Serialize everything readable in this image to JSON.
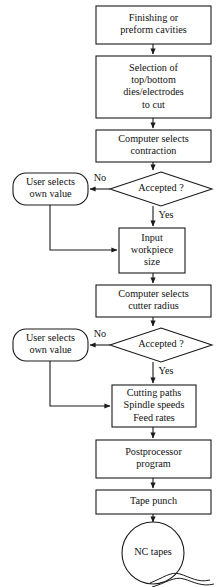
{
  "diagram": {
    "background_color": "#ffffff",
    "line_color": "#1a1a1a",
    "text_color": "#111111",
    "nodes": [
      {
        "id": "finishing",
        "name": "node-finishing-or-preform-cavities",
        "shape": "rect",
        "x": 96,
        "y": 6,
        "w": 115,
        "h": 38,
        "lines": [
          "Finishing or",
          "preform cavities"
        ]
      },
      {
        "id": "selection",
        "name": "node-selection-of-dies-electrodes",
        "shape": "rect",
        "x": 96,
        "y": 56,
        "w": 115,
        "h": 62,
        "lines": [
          "Selection of",
          "top/bottom",
          "dies/electrodes",
          "to cut"
        ]
      },
      {
        "id": "contraction",
        "name": "node-computer-selects-contraction",
        "shape": "rect",
        "x": 96,
        "y": 130,
        "w": 115,
        "h": 32,
        "lines": [
          "Computer selects",
          "contraction"
        ]
      },
      {
        "id": "accepted1",
        "name": "decision-accepted-contraction",
        "shape": "diamond",
        "x": 110,
        "y": 172,
        "w": 102,
        "h": 34,
        "lines": [
          "Accepted ?"
        ]
      },
      {
        "id": "uservalue1",
        "name": "node-user-selects-own-value-contraction",
        "shape": "roundrect",
        "x": 13,
        "y": 173,
        "w": 75,
        "h": 32,
        "lines": [
          "User selects",
          "own value"
        ]
      },
      {
        "id": "inputsize",
        "name": "node-input-workpiece-size",
        "shape": "rect",
        "x": 119,
        "y": 228,
        "w": 66,
        "h": 45,
        "lines": [
          "Input",
          "workpiece",
          "size"
        ]
      },
      {
        "id": "cutterradius",
        "name": "node-computer-selects-cutter-radius",
        "shape": "rect",
        "x": 96,
        "y": 285,
        "w": 115,
        "h": 32,
        "lines": [
          "Computer selects",
          "cutter radius"
        ]
      },
      {
        "id": "accepted2",
        "name": "decision-accepted-cutter-radius",
        "shape": "diamond",
        "x": 110,
        "y": 328,
        "w": 102,
        "h": 34,
        "lines": [
          "Accepted ?"
        ]
      },
      {
        "id": "uservalue2",
        "name": "node-user-selects-own-value-cutter",
        "shape": "roundrect",
        "x": 13,
        "y": 329,
        "w": 75,
        "h": 32,
        "lines": [
          "User selects",
          "own value"
        ]
      },
      {
        "id": "cuttingpaths",
        "name": "node-cutting-paths-spindle-speeds-feed-rates",
        "shape": "rect",
        "x": 112,
        "y": 385,
        "w": 84,
        "h": 42,
        "lines": [
          "Cutting paths",
          "Spindle speeds",
          "Feed rates"
        ]
      },
      {
        "id": "postprocessor",
        "name": "node-postprocessor-program",
        "shape": "rect",
        "x": 96,
        "y": 440,
        "w": 115,
        "h": 38,
        "lines": [
          "Postprocessor",
          "program"
        ]
      },
      {
        "id": "tapepunch",
        "name": "node-tape-punch",
        "shape": "rect",
        "x": 96,
        "y": 490,
        "w": 115,
        "h": 24,
        "lines": [
          "Tape punch"
        ]
      },
      {
        "id": "nctapes",
        "name": "node-nc-tapes",
        "shape": "circle",
        "cx": 153,
        "cy": 553,
        "r": 31,
        "lines": [
          "NC tapes"
        ]
      }
    ],
    "edges": [
      {
        "name": "edge-finishing-to-selection",
        "from": "finishing",
        "to": "selection",
        "path": "M153,44 L153,54",
        "arrow": true
      },
      {
        "name": "edge-selection-to-contraction",
        "from": "selection",
        "to": "contraction",
        "path": "M153,118 L153,128",
        "arrow": true
      },
      {
        "name": "edge-contraction-to-accepted1",
        "from": "contraction",
        "to": "accepted1",
        "path": "M153,162 L153,170",
        "arrow": true
      },
      {
        "name": "edge-accepted1-no-to-uservalue1",
        "from": "accepted1",
        "to": "uservalue1",
        "path": "M110,189 L90,189",
        "arrow": true
      },
      {
        "name": "edge-accepted1-yes-to-inputsize",
        "from": "accepted1",
        "to": "inputsize",
        "path": "M153,206 L153,226",
        "arrow": true
      },
      {
        "name": "edge-uservalue1-to-inputsize",
        "from": "uservalue1",
        "to": "inputsize",
        "path": "M50,205 L50,250 L117,250",
        "arrow": true
      },
      {
        "name": "edge-inputsize-to-cutterradius",
        "from": "inputsize",
        "to": "cutterradius",
        "path": "M153,273 L153,283",
        "arrow": true
      },
      {
        "name": "edge-cutterradius-to-accepted2",
        "from": "cutterradius",
        "to": "accepted2",
        "path": "M153,317 L153,326",
        "arrow": true
      },
      {
        "name": "edge-accepted2-no-to-uservalue2",
        "from": "accepted2",
        "to": "uservalue2",
        "path": "M110,345 L90,345",
        "arrow": true
      },
      {
        "name": "edge-accepted2-yes-to-cuttingpaths",
        "from": "accepted2",
        "to": "cuttingpaths",
        "path": "M153,362 L153,383",
        "arrow": true
      },
      {
        "name": "edge-uservalue2-to-cuttingpaths",
        "from": "uservalue2",
        "to": "cuttingpaths",
        "path": "M50,361 L50,406 L110,406",
        "arrow": true
      },
      {
        "name": "edge-cuttingpaths-to-postprocessor",
        "from": "cuttingpaths",
        "to": "postprocessor",
        "path": "M153,427 L153,438",
        "arrow": true
      },
      {
        "name": "edge-postprocessor-to-tapepunch",
        "from": "postprocessor",
        "to": "tapepunch",
        "path": "M153,478 L153,488",
        "arrow": true
      },
      {
        "name": "edge-tapepunch-to-nctapes",
        "from": "tapepunch",
        "to": "nctapes",
        "path": "M153,514 L153,522",
        "arrow": true
      }
    ],
    "edge_labels": [
      {
        "name": "edge-label-no-contraction",
        "text": "No",
        "x": 100,
        "y": 179
      },
      {
        "name": "edge-label-yes-contraction",
        "text": "Yes",
        "x": 166,
        "y": 216
      },
      {
        "name": "edge-label-no-cutter",
        "text": "No",
        "x": 100,
        "y": 335
      },
      {
        "name": "edge-label-yes-cutter",
        "text": "Yes",
        "x": 166,
        "y": 372
      }
    ],
    "tape_tail": {
      "name": "tape-tail-decoration",
      "paths": [
        "M150,583 C163,578 171,571 180,574 C190,577 198,583 210,580",
        "M152,587 C166,583 174,576 184,579 C194,582 202,587 214,584"
      ]
    }
  }
}
